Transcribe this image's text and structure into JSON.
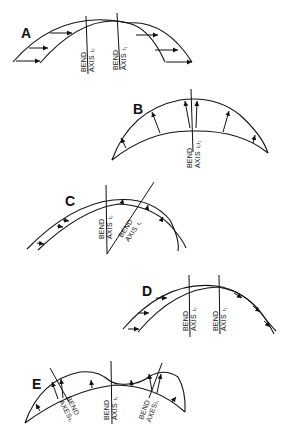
{
  "figure": {
    "panels": [
      {
        "id": "A",
        "label": "A",
        "axes": [
          {
            "line1": "BEND",
            "line2": "AXIS",
            "subscript": "t0",
            "sub_display": "t₀"
          },
          {
            "line1": "BEND",
            "line2": "AXIS",
            "subscript": "t1",
            "sub_display": "t₁"
          }
        ],
        "arrow_direction": "horizontal-right"
      },
      {
        "id": "B",
        "label": "B",
        "axes": [
          {
            "line1": "BEND",
            "line2": "AXIS",
            "subscript": "t0,t1",
            "sub_display": "t₀t₁"
          }
        ],
        "arrow_direction": "radial-outward"
      },
      {
        "id": "C",
        "label": "C",
        "axes": [
          {
            "line1": "BEND",
            "line2": "AXIS",
            "subscript": "t0",
            "sub_display": "t₀"
          },
          {
            "line1": "BEND",
            "line2": "AXIS",
            "subscript": "t1",
            "sub_display": "t₁"
          }
        ],
        "arrow_direction": "rotational"
      },
      {
        "id": "D",
        "label": "D",
        "axes": [
          {
            "line1": "BEND",
            "line2": "AXIS",
            "subscript": "t0",
            "sub_display": "t₀"
          },
          {
            "line1": "BEND",
            "line2": "AXIS",
            "subscript": "t1",
            "sub_display": "t₁"
          }
        ],
        "arrow_direction": "along-curve"
      },
      {
        "id": "E",
        "label": "E",
        "axes": [
          {
            "line1": "BEND",
            "line2": "AXES",
            "subscript": "t1",
            "sub_display": "t₁"
          },
          {
            "line1": "BEND",
            "line2": "AXIS",
            "subscript": "t0",
            "sub_display": "t₀"
          },
          {
            "line1": "BEND",
            "line2": "AXES",
            "subscript": "t1",
            "sub_display": "t₁"
          }
        ],
        "arrow_direction": "radial-outward-double"
      }
    ]
  }
}
